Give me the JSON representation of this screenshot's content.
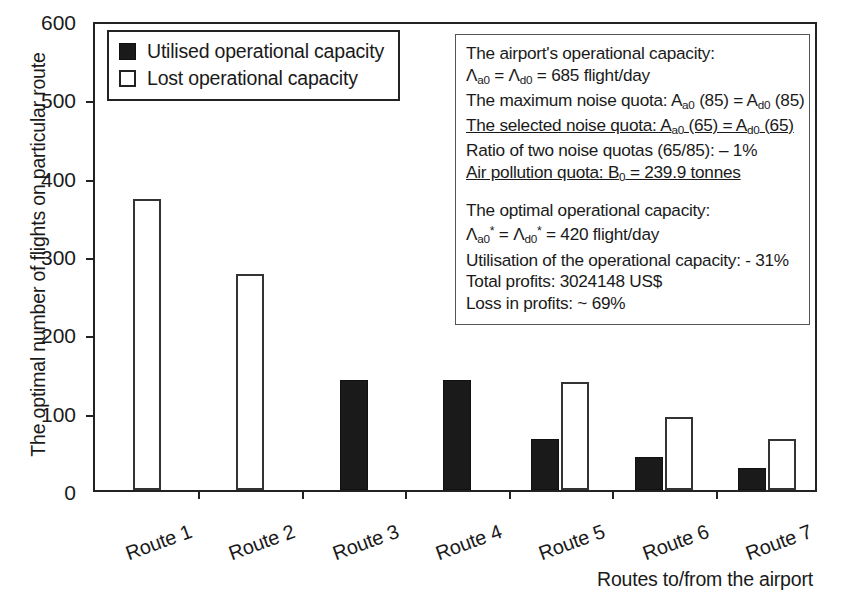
{
  "chart_data": {
    "type": "bar",
    "title": "",
    "xlabel": "Routes to/from the airport",
    "ylabel": "The optimal number of flights on particular route",
    "categories": [
      "Route 1",
      "Route 2",
      "Route 3",
      "Route 4",
      "Route 5",
      "Route 6",
      "Route 7"
    ],
    "series": [
      {
        "name": "Utilised operational capacity",
        "color": "#1a1a1a",
        "style": "filled",
        "values": [
          0,
          0,
          140,
          140,
          65,
          42,
          28
        ]
      },
      {
        "name": "Lost operational capacity",
        "color": "#ffffff",
        "style": "hollow",
        "values": [
          372,
          276,
          0,
          0,
          138,
          93,
          65
        ]
      }
    ],
    "ylim": [
      0,
      600
    ],
    "yticks": [
      0,
      100,
      200,
      300,
      400,
      500,
      600
    ],
    "ytick_labels": [
      "0",
      "100",
      "200",
      "300",
      "400",
      "500",
      "600"
    ],
    "grid": false,
    "legend_position": "top-left",
    "xtick_label_rotation": -20
  },
  "legend": {
    "items": [
      {
        "label": "Utilised operational capacity",
        "swatch": "filled-square-icon"
      },
      {
        "label": "Lost operational capacity",
        "swatch": "hollow-square-icon"
      }
    ]
  },
  "annotation": {
    "lines": [
      {
        "html": "The airport's operational capacity:",
        "underline": false
      },
      {
        "html": "&Lambda;<sub>a0</sub> = &Lambda;<sub>d0</sub> = 685 flight/day",
        "underline": false
      },
      {
        "html": "The maximum noise quota: A<sub>a0</sub> (85) = A<sub>d0</sub> (85)",
        "underline": false
      },
      {
        "html": "The selected noise quota: A<sub>a0</sub> (65) = A<sub>d0</sub> (65)",
        "underline": true
      },
      {
        "html": "Ratio of two noise quotas (65/85): &ndash; 1%",
        "underline": false
      },
      {
        "html": "Air pollution quota: B<sub>0</sub> = 239.9 tonnes",
        "underline": true
      },
      {
        "html": "",
        "underline": false,
        "gap": true
      },
      {
        "html": "The optimal operational capacity:",
        "underline": false
      },
      {
        "html": "&Lambda;<sub>a0</sub><sup>*</sup> = &Lambda;<sub>d0</sub><sup>*</sup> = 420 flight/day",
        "underline": false
      },
      {
        "html": "Utilisation of the operational capacity: - 31%",
        "underline": false
      },
      {
        "html": "Total profits: 3024148 US$",
        "underline": false
      },
      {
        "html": "Loss in profits: ~ 69%",
        "underline": false
      }
    ]
  }
}
